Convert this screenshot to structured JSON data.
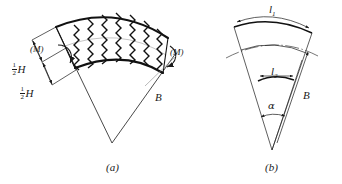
{
  "figure": {
    "background_color": "#ffffff",
    "line_color": "#1a1a1a",
    "panels": [
      {
        "caption": "(a)",
        "description": "Curved wedge segment with zigzag hatching, applied moments and half-depth dimensions",
        "labels": {
          "moment_left": "(M)",
          "moment_right": "(M)",
          "half_depth_upper": "H",
          "half_depth_lower": "H",
          "fraction_numerator": "1",
          "fraction_denominator": "2",
          "radius_b": "B"
        }
      },
      {
        "caption": "(b)",
        "description": "Sector geometry showing outer arc length, inner arc length, radius and included angle",
        "labels": {
          "outer_arc": "l",
          "outer_arc_sub": "1",
          "inner_arc": "l",
          "inner_arc_sub": "2",
          "radius_b": "B",
          "angle_alpha": "α"
        }
      }
    ]
  }
}
